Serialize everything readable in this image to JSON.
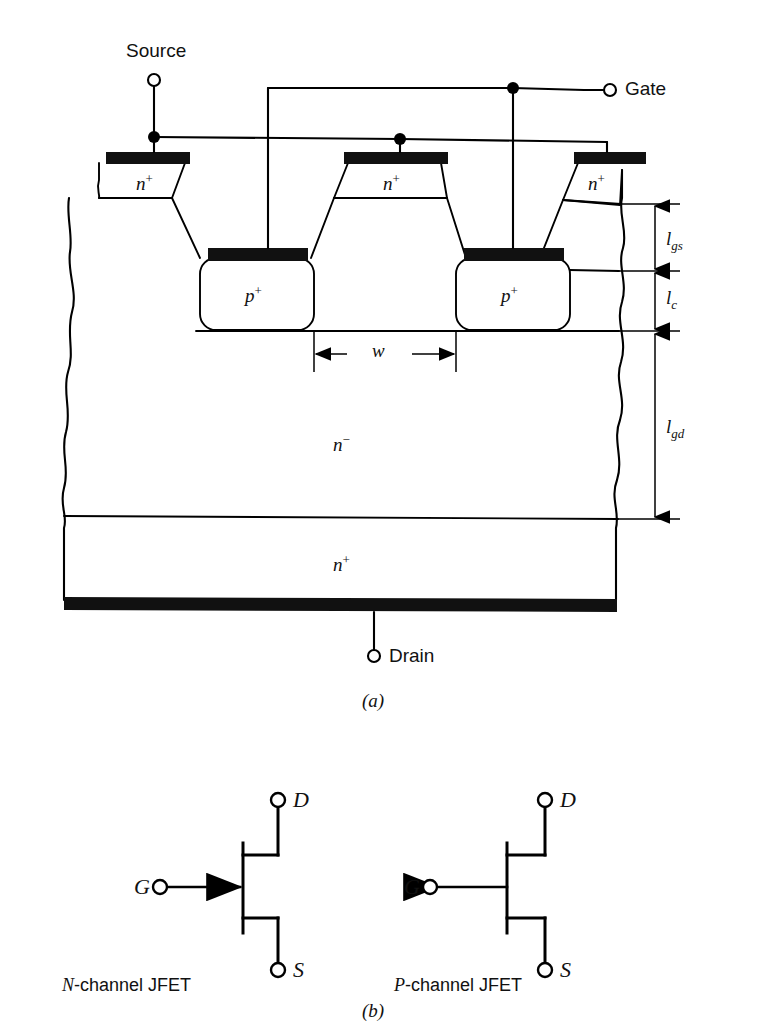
{
  "figure": {
    "line_color": "#000000",
    "fill_color": "#ffffff",
    "metal_color": "#111111",
    "background": "#ffffff"
  },
  "part_a": {
    "caption": "(a)",
    "terminals": {
      "source": "Source",
      "gate": "Gate",
      "drain": "Drain"
    },
    "regions": [
      {
        "id": "nplus-mesa-left",
        "label_n": "n",
        "label_sup": "+"
      },
      {
        "id": "nplus-mesa-middle",
        "label_n": "n",
        "label_sup": "+"
      },
      {
        "id": "nplus-mesa-right",
        "label_n": "n",
        "label_sup": "+"
      },
      {
        "id": "pplus-left",
        "label_n": "p",
        "label_sup": "+"
      },
      {
        "id": "pplus-right",
        "label_n": "p",
        "label_sup": "+"
      },
      {
        "id": "nminus-drift",
        "label_n": "n",
        "label_sup": "−"
      },
      {
        "id": "nplus-substrate",
        "label_n": "n",
        "label_sup": "+"
      }
    ],
    "dimensions": [
      {
        "id": "w",
        "base": "w",
        "subscript": ""
      },
      {
        "id": "lgs",
        "base": "l",
        "subscript": "gs"
      },
      {
        "id": "lc",
        "base": "l",
        "subscript": "c"
      },
      {
        "id": "lgd",
        "base": "l",
        "subscript": "gd"
      }
    ]
  },
  "part_b": {
    "caption": "(b)",
    "symbols": [
      {
        "id": "n-channel-jfet",
        "name_prefix": "N",
        "name_rest": "-channel JFET",
        "gate": "G",
        "drain": "D",
        "source": "S",
        "arrow_direction": "right"
      },
      {
        "id": "p-channel-jfet",
        "name_prefix": "P",
        "name_rest": "-channel JFET",
        "gate": "G",
        "drain": "D",
        "source": "S",
        "arrow_direction": "left"
      }
    ]
  }
}
